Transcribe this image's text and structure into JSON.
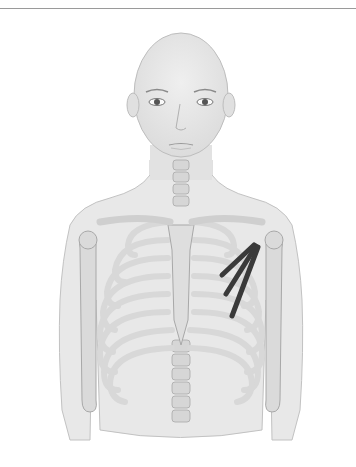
{
  "figure": {
    "highlight": "pectoralis minor muscle (left side of body, right side of image)",
    "colors": {
      "skin": "#e6e6e6",
      "skin_outline": "#b8b8b8",
      "bone": "#dcdcdc",
      "bone_outline": "#a8a8a8",
      "muscle": "#3a3a3a",
      "rule": "#9a9a9a"
    }
  }
}
